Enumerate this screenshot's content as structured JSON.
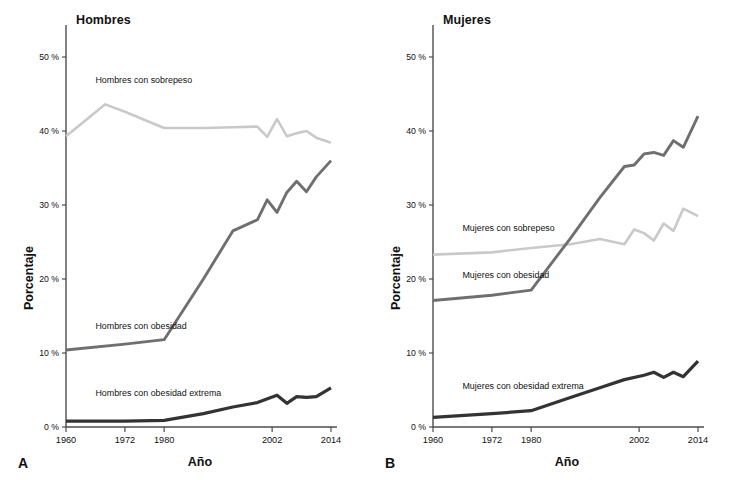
{
  "figure": {
    "background": "#ffffff",
    "width": 734,
    "height": 480
  },
  "colors": {
    "sobrepeso": "#c9c9c9",
    "obesidad": "#6f6f6f",
    "obesidad_extrema": "#333333",
    "axis": "#4d4d4d",
    "text": "#111111"
  },
  "panels": {
    "a": {
      "letter": "A",
      "title": "Hombres",
      "xlabel": "Año",
      "ylabel": "Porcentaje",
      "labels": {
        "sobrepeso": "Hombres con sobrepeso",
        "obesidad": "Hombres con obesidad",
        "obesidad_extrema": "Hombres con obesidad extrema"
      }
    },
    "b": {
      "letter": "B",
      "title": "Mujeres",
      "xlabel": "Año",
      "ylabel": "Porcentaje",
      "labels": {
        "sobrepeso": "Mujeres con sobrepeso",
        "obesidad": "Mujeres con obesidad",
        "obesidad_extrema": "Mujeres con obesidad extrema"
      }
    }
  },
  "axes": {
    "y_ticks": [
      "0 %",
      "10 %",
      "20 %",
      "30 %",
      "40 %",
      "50 %"
    ],
    "y_tick_values": [
      0,
      10,
      20,
      30,
      40,
      50
    ],
    "y_range": [
      0,
      55
    ],
    "x_ticks": [
      "1960",
      "1972",
      "1980",
      "2002",
      "2014"
    ],
    "x_tick_values": [
      1960,
      1972,
      1980,
      2002,
      2014
    ],
    "x_range": [
      1960,
      2014
    ],
    "grid": false
  },
  "chart_data": [
    {
      "type": "line",
      "panel": "A",
      "title": "Hombres",
      "xlabel": "Año",
      "ylabel": "Porcentaje",
      "xlim": [
        1960,
        2014
      ],
      "ylim": [
        0,
        55
      ],
      "grid": false,
      "legend": "inline-annotations",
      "series": [
        {
          "name": "Hombres con sobrepeso",
          "color": "#c9c9c9",
          "x": [
            1960,
            1968,
            1972,
            1980,
            1988,
            1994,
            1999,
            2001,
            2003,
            2005,
            2007,
            2009,
            2011,
            2014
          ],
          "y": [
            39.3,
            43.6,
            42.6,
            40.4,
            40.4,
            40.5,
            40.6,
            39.2,
            41.6,
            39.3,
            39.7,
            40.0,
            39.1,
            38.4
          ]
        },
        {
          "name": "Hombres con obesidad",
          "color": "#6f6f6f",
          "x": [
            1960,
            1972,
            1980,
            1988,
            1994,
            1999,
            2001,
            2003,
            2005,
            2007,
            2009,
            2011,
            2014
          ],
          "y": [
            10.4,
            11.2,
            11.8,
            20.0,
            26.5,
            28.0,
            30.7,
            29.0,
            31.7,
            33.2,
            31.8,
            33.8,
            36.0
          ]
        },
        {
          "name": "Hombres con obesidad extrema",
          "color": "#333333",
          "x": [
            1960,
            1972,
            1980,
            1988,
            1994,
            1999,
            2003,
            2005,
            2007,
            2009,
            2011,
            2014
          ],
          "y": [
            0.8,
            0.8,
            0.9,
            1.8,
            2.7,
            3.3,
            4.3,
            3.2,
            4.1,
            4.0,
            4.1,
            5.3
          ]
        }
      ]
    },
    {
      "type": "line",
      "panel": "B",
      "title": "Mujeres",
      "xlabel": "Año",
      "ylabel": "Porcentaje",
      "xlim": [
        1960,
        2014
      ],
      "ylim": [
        0,
        55
      ],
      "grid": false,
      "legend": "inline-annotations",
      "series": [
        {
          "name": "Mujeres con sobrepeso",
          "color": "#c9c9c9",
          "x": [
            1960,
            1972,
            1980,
            1988,
            1994,
            1999,
            2001,
            2003,
            2005,
            2007,
            2009,
            2011,
            2014
          ],
          "y": [
            23.3,
            23.6,
            24.2,
            24.7,
            25.4,
            24.7,
            26.7,
            26.2,
            25.2,
            27.5,
            26.5,
            29.5,
            28.5
          ]
        },
        {
          "name": "Mujeres con obesidad",
          "color": "#6f6f6f",
          "x": [
            1960,
            1972,
            1980,
            1988,
            1994,
            1999,
            2001,
            2003,
            2005,
            2007,
            2009,
            2011,
            2014
          ],
          "y": [
            17.1,
            17.8,
            18.5,
            25.5,
            31.0,
            35.2,
            35.4,
            36.9,
            37.1,
            36.7,
            38.7,
            37.8,
            42.0
          ]
        },
        {
          "name": "Mujeres con obesidad extrema",
          "color": "#333333",
          "x": [
            1960,
            1972,
            1980,
            1988,
            1994,
            1999,
            2003,
            2005,
            2007,
            2009,
            2011,
            2014
          ],
          "y": [
            1.3,
            1.8,
            2.2,
            4.0,
            5.3,
            6.4,
            7.0,
            7.4,
            6.7,
            7.4,
            6.8,
            8.9
          ]
        }
      ]
    }
  ],
  "annotations": {
    "a_sobrepeso_label_xy": [
      1966,
      46.5
    ],
    "a_obesidad_label_xy": [
      1966,
      13.2
    ],
    "a_extrema_label_xy": [
      1966,
      4.2
    ],
    "b_sobrepeso_label_xy": [
      1966,
      26.5
    ],
    "b_obesidad_label_xy": [
      1966,
      20.2
    ],
    "b_extrema_label_xy": [
      1966,
      5.2
    ]
  }
}
